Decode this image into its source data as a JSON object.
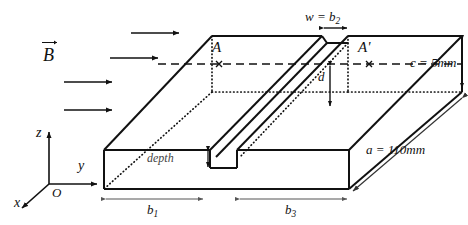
{
  "figure": {
    "type": "engineering-diagram",
    "background_color": "#ffffff",
    "line_color": "#111111"
  },
  "field": {
    "symbol_letter": "B",
    "arrow_count": 4,
    "direction": "left-to-right",
    "description": "Magnetic field vector arrows pointing in +y direction"
  },
  "axes": {
    "origin_label": "O",
    "z_label": "z",
    "y_label": "y",
    "x_label": "x"
  },
  "sections": {
    "left_label": "A",
    "right_label": "A'"
  },
  "dimensions": {
    "length": "a = 110mm",
    "height": "c = 5mm",
    "groove_width": "w = b",
    "groove_width_sub": "2",
    "depth_label": "depth",
    "offset_label": "d",
    "segment_left": "b",
    "segment_left_sub": "1",
    "segment_right": "b",
    "segment_right_sub": "3"
  }
}
